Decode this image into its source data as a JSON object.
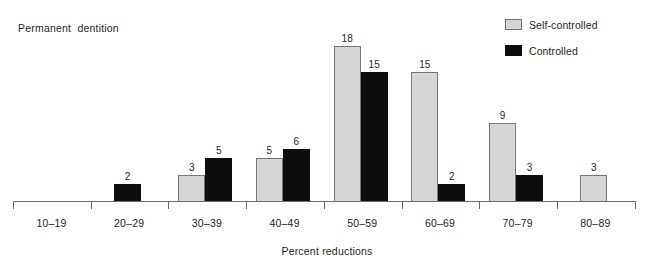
{
  "chart_data": {
    "type": "bar",
    "title": "Permanent  dentition",
    "subtitle": "",
    "xlabel": "Percent reductions",
    "ylabel": "",
    "grid": false,
    "legend_position": "top-right",
    "ylim": [
      0,
      21
    ],
    "categories": [
      "10–19",
      "20–29",
      "30–39",
      "40–49",
      "50–59",
      "60–69",
      "70–79",
      "80–89"
    ],
    "series": [
      {
        "name": "Self-controlled",
        "color": "#d6d6d6",
        "values": [
          null,
          null,
          3,
          5,
          18,
          15,
          9,
          3
        ],
        "value_labels": [
          "",
          "",
          "3",
          "5",
          "18",
          "15",
          "9",
          "3"
        ]
      },
      {
        "name": "Controlled",
        "color": "#0d0d0d",
        "values": [
          null,
          2,
          5,
          6,
          15,
          2,
          3,
          null
        ],
        "value_labels": [
          "",
          "2",
          "5",
          "6",
          "15",
          "2",
          "3",
          ""
        ]
      }
    ]
  },
  "axis": {
    "tick_count": 9
  }
}
